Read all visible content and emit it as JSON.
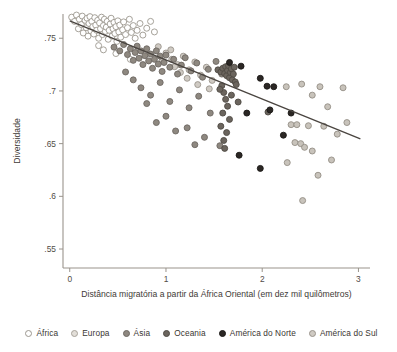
{
  "chart_data": {
    "type": "scatter",
    "title": "",
    "xlabel": "Distância migratória a partir da África Oriental (em dez mil quilômetros)",
    "ylabel": "Diversidade",
    "xlim": [
      -0.07,
      3.12
    ],
    "ylim": [
      0.532,
      0.773
    ],
    "xticks": [
      0,
      1,
      2,
      3
    ],
    "xticklabels": [
      "0",
      "1",
      "2",
      "3"
    ],
    "yticks": [
      0.55,
      0.6,
      0.65,
      0.7,
      0.75
    ],
    "yticklabels": [
      ".55",
      ".6",
      ".65",
      ".7",
      ".75"
    ],
    "grid": false,
    "legend_position": "bottom",
    "trendline": {
      "name": "regressão linear",
      "x0": 0.0,
      "y0": 0.7665,
      "x1": 3.02,
      "y1": 0.6545,
      "color": "#4a4540"
    },
    "series": [
      {
        "name": "África",
        "marker": "open-circle",
        "fill": "#ffffff",
        "stroke": "#9c978f",
        "points": [
          [
            0.02,
            0.77
          ],
          [
            0.05,
            0.766
          ],
          [
            0.07,
            0.772
          ],
          [
            0.09,
            0.759
          ],
          [
            0.1,
            0.768
          ],
          [
            0.12,
            0.763
          ],
          [
            0.13,
            0.771
          ],
          [
            0.14,
            0.755
          ],
          [
            0.16,
            0.767
          ],
          [
            0.17,
            0.76
          ],
          [
            0.18,
            0.769
          ],
          [
            0.19,
            0.752
          ],
          [
            0.2,
            0.764
          ],
          [
            0.21,
            0.7705
          ],
          [
            0.22,
            0.757
          ],
          [
            0.23,
            0.766
          ],
          [
            0.24,
            0.761
          ],
          [
            0.25,
            0.754
          ],
          [
            0.26,
            0.7695
          ],
          [
            0.27,
            0.7625
          ],
          [
            0.28,
            0.7575
          ],
          [
            0.29,
            0.767
          ],
          [
            0.3,
            0.75
          ],
          [
            0.31,
            0.7645
          ],
          [
            0.32,
            0.759
          ],
          [
            0.33,
            0.77
          ],
          [
            0.34,
            0.7535
          ],
          [
            0.35,
            0.762
          ],
          [
            0.36,
            0.768
          ],
          [
            0.37,
            0.7565
          ],
          [
            0.38,
            0.7605
          ],
          [
            0.39,
            0.766
          ],
          [
            0.4,
            0.749
          ],
          [
            0.41,
            0.7575
          ],
          [
            0.42,
            0.7635
          ],
          [
            0.43,
            0.769
          ],
          [
            0.44,
            0.752
          ],
          [
            0.45,
            0.759
          ],
          [
            0.46,
            0.765
          ],
          [
            0.47,
            0.7545
          ],
          [
            0.48,
            0.761
          ],
          [
            0.49,
            0.747
          ],
          [
            0.5,
            0.7665
          ],
          [
            0.51,
            0.756
          ],
          [
            0.52,
            0.7625
          ],
          [
            0.53,
            0.751
          ],
          [
            0.55,
            0.758
          ],
          [
            0.56,
            0.7655
          ],
          [
            0.58,
            0.7535
          ],
          [
            0.6,
            0.76
          ],
          [
            0.62,
            0.768
          ],
          [
            0.64,
            0.7555
          ],
          [
            0.66,
            0.762
          ],
          [
            0.68,
            0.75
          ],
          [
            0.7,
            0.7575
          ],
          [
            0.73,
            0.764
          ],
          [
            0.76,
            0.753
          ],
          [
            0.8,
            0.7595
          ],
          [
            0.84,
            0.766
          ],
          [
            0.88,
            0.756
          ],
          [
            0.35,
            0.739
          ],
          [
            0.48,
            0.7355
          ],
          [
            0.63,
            0.73
          ],
          [
            0.3,
            0.743
          ]
        ]
      },
      {
        "name": "Europa",
        "marker": "light-filled-circle",
        "fill": "#cfcac3",
        "stroke": "#9a948c",
        "points": [
          [
            0.92,
            0.742
          ],
          [
            1.0,
            0.736
          ],
          [
            1.06,
            0.73
          ],
          [
            1.12,
            0.725
          ],
          [
            1.18,
            0.733
          ],
          [
            1.24,
            0.72
          ],
          [
            1.3,
            0.7275
          ],
          [
            1.36,
            0.715
          ],
          [
            1.42,
            0.7225
          ],
          [
            1.48,
            0.71
          ],
          [
            1.05,
            0.739
          ],
          [
            1.15,
            0.7175
          ],
          [
            1.22,
            0.712
          ],
          [
            1.33,
            0.706
          ],
          [
            1.45,
            0.702
          ],
          [
            0.96,
            0.7285
          ],
          [
            1.09,
            0.723
          ]
        ]
      },
      {
        "name": "Ásia",
        "marker": "mid-filled-circle",
        "fill": "#8e8880",
        "stroke": "#6d6862",
        "points": [
          [
            0.46,
            0.7415
          ],
          [
            0.52,
            0.738
          ],
          [
            0.56,
            0.744
          ],
          [
            0.6,
            0.7345
          ],
          [
            0.63,
            0.74
          ],
          [
            0.66,
            0.729
          ],
          [
            0.68,
            0.7365
          ],
          [
            0.7,
            0.7425
          ],
          [
            0.72,
            0.731
          ],
          [
            0.74,
            0.738
          ],
          [
            0.76,
            0.725
          ],
          [
            0.78,
            0.7335
          ],
          [
            0.8,
            0.74
          ],
          [
            0.82,
            0.7285
          ],
          [
            0.84,
            0.735
          ],
          [
            0.86,
            0.7215
          ],
          [
            0.88,
            0.73
          ],
          [
            0.9,
            0.738
          ],
          [
            0.92,
            0.7255
          ],
          [
            0.94,
            0.733
          ],
          [
            0.96,
            0.7185
          ],
          [
            0.98,
            0.727
          ],
          [
            1.0,
            0.734
          ],
          [
            1.04,
            0.7225
          ],
          [
            1.08,
            0.73
          ],
          [
            1.12,
            0.716
          ],
          [
            1.16,
            0.7245
          ],
          [
            1.2,
            0.7315
          ],
          [
            1.26,
            0.719
          ],
          [
            1.32,
            0.7265
          ],
          [
            1.38,
            0.713
          ],
          [
            1.44,
            0.7205
          ],
          [
            1.52,
            0.728
          ],
          [
            1.58,
            0.716
          ],
          [
            1.64,
            0.723
          ],
          [
            0.58,
            0.718
          ],
          [
            0.66,
            0.7105
          ],
          [
            0.74,
            0.703
          ],
          [
            0.84,
            0.696
          ],
          [
            0.94,
            0.708
          ],
          [
            1.04,
            0.69
          ],
          [
            1.14,
            0.701
          ],
          [
            1.24,
            0.684
          ],
          [
            1.34,
            0.695
          ],
          [
            1.46,
            0.679
          ],
          [
            0.8,
            0.688
          ],
          [
            1.0,
            0.676
          ],
          [
            1.22,
            0.665
          ],
          [
            1.4,
            0.656
          ],
          [
            1.56,
            0.648
          ],
          [
            0.9,
            0.67
          ],
          [
            1.1,
            0.662
          ],
          [
            1.3,
            0.649
          ]
        ]
      },
      {
        "name": "Oceania",
        "marker": "dark-filled-circle",
        "fill": "#6b655e",
        "stroke": "#4e4943",
        "points": [
          [
            1.54,
            0.72
          ],
          [
            1.57,
            0.718
          ],
          [
            1.59,
            0.7215
          ],
          [
            1.61,
            0.7165
          ],
          [
            1.62,
            0.723
          ],
          [
            1.63,
            0.7145
          ],
          [
            1.64,
            0.7195
          ],
          [
            1.65,
            0.724
          ],
          [
            1.66,
            0.7125
          ],
          [
            1.67,
            0.7175
          ],
          [
            1.68,
            0.721
          ],
          [
            1.69,
            0.7105
          ],
          [
            1.7,
            0.716
          ],
          [
            1.71,
            0.7225
          ],
          [
            1.72,
            0.7085
          ],
          [
            1.58,
            0.705
          ],
          [
            1.6,
            0.6985
          ],
          [
            1.62,
            0.692
          ],
          [
            1.56,
            0.7015
          ],
          [
            1.64,
            0.6855
          ],
          [
            1.59,
            0.679
          ],
          [
            1.66,
            0.673
          ],
          [
            1.57,
            0.6665
          ],
          [
            1.63,
            0.6605
          ],
          [
            1.6,
            0.653
          ],
          [
            1.73,
            0.706
          ],
          [
            1.68,
            0.696
          ],
          [
            1.75,
            0.6895
          ],
          [
            1.61,
            0.6455
          ],
          [
            2.06,
            0.68
          ]
        ]
      },
      {
        "name": "América do Norte",
        "marker": "black-circle",
        "fill": "#2b2724",
        "stroke": "#1b1816",
        "points": [
          [
            1.66,
            0.727
          ],
          [
            1.78,
            0.7235
          ],
          [
            1.98,
            0.712
          ],
          [
            2.05,
            0.7045
          ],
          [
            2.12,
            0.704
          ],
          [
            1.84,
            0.679
          ],
          [
            2.08,
            0.682
          ],
          [
            2.22,
            0.658
          ],
          [
            1.98,
            0.6265
          ],
          [
            1.76,
            0.639
          ],
          [
            2.3,
            0.679
          ]
        ]
      },
      {
        "name": "América do Sul",
        "marker": "pale-filled-circle",
        "fill": "#c8c3bb",
        "stroke": "#948e86",
        "points": [
          [
            2.25,
            0.704
          ],
          [
            2.41,
            0.7065
          ],
          [
            2.6,
            0.704
          ],
          [
            2.84,
            0.703
          ],
          [
            2.52,
            0.696
          ],
          [
            2.68,
            0.685
          ],
          [
            2.3,
            0.668
          ],
          [
            2.36,
            0.668
          ],
          [
            2.48,
            0.667
          ],
          [
            2.64,
            0.6665
          ],
          [
            2.78,
            0.659
          ],
          [
            2.34,
            0.651
          ],
          [
            2.4,
            0.65
          ],
          [
            2.44,
            0.6465
          ],
          [
            2.52,
            0.643
          ],
          [
            2.26,
            0.632
          ],
          [
            2.88,
            0.67
          ],
          [
            2.58,
            0.62
          ],
          [
            2.42,
            0.596
          ],
          [
            2.72,
            0.6345
          ]
        ]
      }
    ]
  },
  "legend": {
    "items": [
      {
        "label": "África",
        "fill": "#ffffff",
        "stroke": "#9c978f"
      },
      {
        "label": "Europa",
        "fill": "#e2ded8",
        "stroke": "#a8a29a"
      },
      {
        "label": "Ásia",
        "fill": "#8e8880",
        "stroke": "#6d6862"
      },
      {
        "label": "Oceania",
        "fill": "#6b655e",
        "stroke": "#4e4943"
      },
      {
        "label": "América do Norte",
        "fill": "#2b2724",
        "stroke": "#1b1816"
      },
      {
        "label": "América do Sul",
        "fill": "#cfcac3",
        "stroke": "#9a948c"
      }
    ]
  }
}
